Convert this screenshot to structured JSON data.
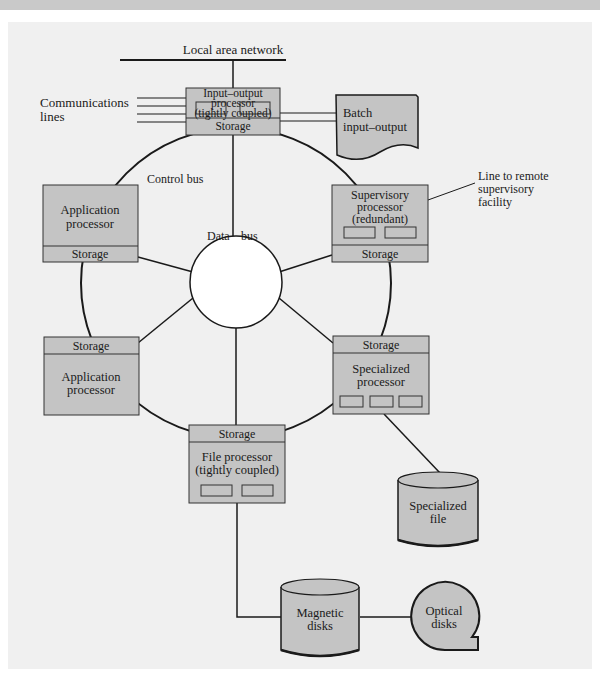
{
  "diagram": {
    "type": "distributed processor network",
    "colors": {
      "background_panel": "#f0f0f0",
      "top_band": "#c9c9c9",
      "box_fill": "#c4c4c4",
      "storage_fill": "#cfcfcf",
      "line": "#1a1a1a",
      "center_circle": "#ffffff"
    },
    "labels": {
      "lan": "Local area network",
      "comm_lines_1": "Communications",
      "comm_lines_2": "lines",
      "control_bus": "Control bus",
      "data_bus_1": "Data",
      "data_bus_2": "bus",
      "remote_1": "Line to remote",
      "remote_2": "supervisory",
      "remote_3": "facility"
    },
    "nodes": {
      "io": {
        "line1": "Input–output",
        "line2": "processor",
        "line3": "(tightly coupled)",
        "storage": "Storage"
      },
      "batch": {
        "line1": "Batch",
        "line2": "input–output"
      },
      "app_top": {
        "line1": "Application",
        "line2": "processor",
        "storage": "Storage"
      },
      "supervisory": {
        "line1": "Supervisory",
        "line2": "processor",
        "line3": "(redundant)",
        "storage": "Storage"
      },
      "app_bottom": {
        "line1": "Application",
        "line2": "processor",
        "storage": "Storage"
      },
      "specialized": {
        "line1": "Specialized",
        "line2": "processor",
        "storage": "Storage"
      },
      "file": {
        "line1": "File processor",
        "line2": "(tightly coupled)",
        "storage": "Storage"
      },
      "spec_file": {
        "line1": "Specialized",
        "line2": "file"
      },
      "magnetic": {
        "line1": "Magnetic",
        "line2": "disks"
      },
      "optical": {
        "line1": "Optical",
        "line2": "disks"
      }
    }
  }
}
